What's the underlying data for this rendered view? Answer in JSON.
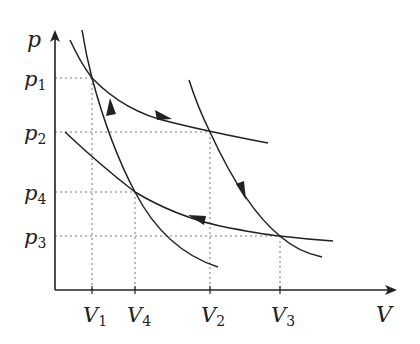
{
  "diagram": {
    "type": "pV-diagram",
    "colors": {
      "ink": "#222222",
      "guide": "#777777",
      "background": "#ffffff"
    },
    "axes": {
      "x_label": "V",
      "y_label": "p"
    },
    "pressure_levels": [
      {
        "id": "p1",
        "base": "p",
        "sub": "1",
        "y": 78
      },
      {
        "id": "p2",
        "base": "p",
        "sub": "2",
        "y": 132
      },
      {
        "id": "p4",
        "base": "p",
        "sub": "4",
        "y": 192
      },
      {
        "id": "p3",
        "base": "p",
        "sub": "3",
        "y": 236
      }
    ],
    "volume_levels": [
      {
        "id": "V1",
        "base": "V",
        "sub": "1",
        "x": 92
      },
      {
        "id": "V4",
        "base": "V",
        "sub": "4",
        "x": 135
      },
      {
        "id": "V2",
        "base": "V",
        "sub": "2",
        "x": 210
      },
      {
        "id": "V3",
        "base": "V",
        "sub": "3",
        "x": 280
      }
    ],
    "states": [
      {
        "name": "1",
        "V": "V1",
        "p": "p1"
      },
      {
        "name": "2",
        "V": "V2",
        "p": "p2"
      },
      {
        "name": "3",
        "V": "V3",
        "p": "p3"
      },
      {
        "name": "4",
        "V": "V4",
        "p": "p4"
      }
    ],
    "curves": [
      {
        "name": "upper-isotherm",
        "from": "1",
        "to": "2",
        "arrow": "right"
      },
      {
        "name": "right-adiabat",
        "from": "2",
        "to": "3",
        "arrow": "down"
      },
      {
        "name": "lower-isotherm",
        "from": "3",
        "to": "4",
        "arrow": "left"
      },
      {
        "name": "left-adiabat",
        "from": "4",
        "to": "1",
        "arrow": "up"
      }
    ]
  }
}
